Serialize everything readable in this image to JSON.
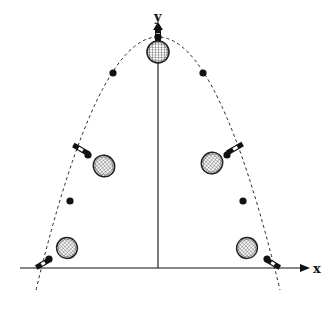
{
  "diagram": {
    "type": "projectile-motion-racket-flip",
    "axes": {
      "x_label": "x",
      "y_label": "y"
    },
    "colors": {
      "stroke": "#111111",
      "background": "#ffffff"
    },
    "trajectory": {
      "shape": "parabola",
      "style": "dashed",
      "apex": [
        158,
        36
      ],
      "ground_crossings": [
        36,
        280
      ]
    },
    "center_of_mass_dots": [
      [
        158,
        36
      ],
      [
        112,
        73
      ],
      [
        204,
        73
      ],
      [
        96,
        157
      ],
      [
        221,
        157
      ],
      [
        70,
        201
      ],
      [
        244,
        201
      ],
      [
        48,
        259
      ],
      [
        268,
        259
      ]
    ],
    "rackets": [
      {
        "position": "top",
        "head": [
          158,
          52
        ],
        "handle_angle": -90
      },
      {
        "position": "upper-left",
        "head": [
          104,
          165
        ],
        "handle_angle": 210
      },
      {
        "position": "upper-right",
        "head": [
          212,
          162
        ],
        "handle_angle": -30
      },
      {
        "position": "lower-left",
        "head": [
          66,
          248
        ],
        "handle_angle": 150
      },
      {
        "position": "lower-right",
        "head": [
          246,
          248
        ],
        "handle_angle": 30
      }
    ]
  }
}
